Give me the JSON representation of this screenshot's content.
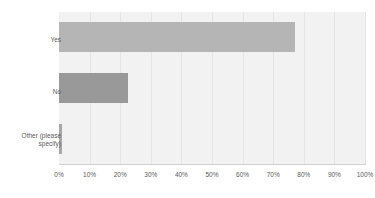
{
  "chart_data": {
    "type": "bar",
    "orientation": "horizontal",
    "title": "",
    "xlabel": "",
    "ylabel": "",
    "categories": [
      "Yes",
      "No",
      "Other (please specify)"
    ],
    "values": [
      77,
      22.5,
      1
    ],
    "series": [
      {
        "name": "Response share",
        "values": [
          77,
          22.5,
          1
        ]
      }
    ],
    "xlim": [
      0,
      100
    ],
    "xticks": [
      0,
      10,
      20,
      30,
      40,
      50,
      60,
      70,
      80,
      90,
      100
    ],
    "xticklabels": [
      "0%",
      "10%",
      "20%",
      "30%",
      "40%",
      "50%",
      "60%",
      "70%",
      "80%",
      "90%",
      "100%"
    ],
    "grid": true,
    "grid_axis": "x",
    "legend": false,
    "legend_position": "none",
    "value_unit": "%",
    "bar_colors": [
      "#b5b5b5",
      "#999999",
      "#a8a8a8"
    ],
    "plot_background": "#f2f2f2",
    "gridline_color": "#e4e4e4",
    "axis_color": "#d2d2d2",
    "tick_label_color": "#5a5a5a"
  },
  "labels": {
    "cat0": "Yes",
    "cat1": "No",
    "cat2": "Other (please\nspecify)"
  },
  "ticks": {
    "t0": "0%",
    "t1": "10%",
    "t2": "20%",
    "t3": "30%",
    "t4": "40%",
    "t5": "50%",
    "t6": "60%",
    "t7": "70%",
    "t8": "80%",
    "t9": "90%",
    "t10": "100%"
  }
}
